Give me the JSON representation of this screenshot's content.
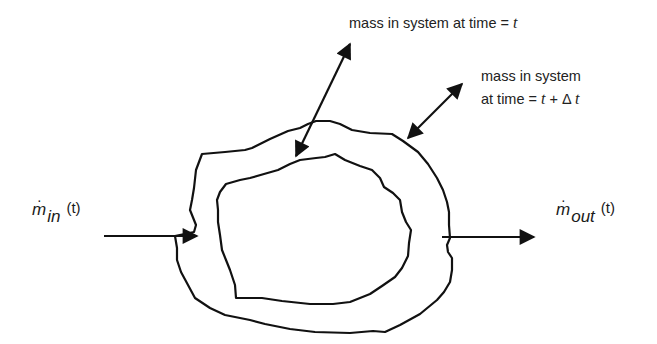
{
  "diagram": {
    "type": "control-volume mass balance",
    "labels": {
      "system_t": {
        "prefix": "mass in system at time = ",
        "var": "t"
      },
      "system_t_dt": {
        "line1": "mass in system",
        "line2_prefix": "at time = ",
        "line2_var1": "t",
        "line2_op": " + Δ ",
        "line2_var2": "t"
      },
      "inflow": {
        "symbol": "m",
        "dot": "·",
        "subscript": "in",
        "arg": "(t)"
      },
      "outflow": {
        "symbol": "m",
        "dot": "·",
        "subscript": "out",
        "arg": "(t)"
      }
    },
    "shapes": [
      {
        "name": "outer-boundary",
        "meaning": "system boundary at time t + Δt"
      },
      {
        "name": "inner-boundary",
        "meaning": "system boundary at time t"
      }
    ],
    "arrows": [
      {
        "name": "arrow-to-inner-boundary",
        "style": "double-headed"
      },
      {
        "name": "arrow-to-outer-boundary",
        "style": "double-headed"
      },
      {
        "name": "inflow-arrow",
        "style": "single-headed",
        "direction": "right"
      },
      {
        "name": "outflow-arrow",
        "style": "single-headed",
        "direction": "right"
      }
    ],
    "colors": {
      "stroke": "#111111",
      "background": "#ffffff"
    }
  }
}
